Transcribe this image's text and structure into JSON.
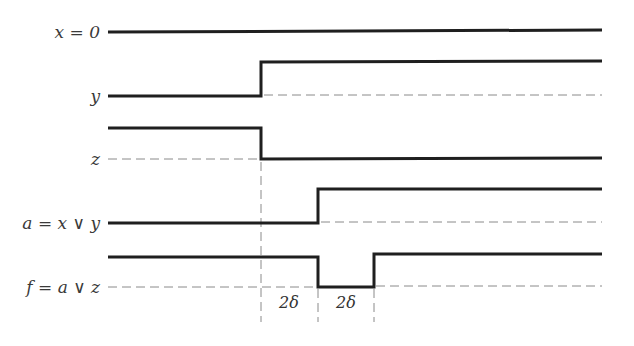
{
  "diagram": {
    "type": "timing-diagram",
    "signals": [
      {
        "id": "x",
        "label": "x = 0",
        "label_y": 38,
        "levels": "constant-high-line",
        "y_line": 32
      },
      {
        "id": "y",
        "label": "y",
        "label_y": 102,
        "low_y": 96,
        "high_y": 62,
        "rise_at": 261
      },
      {
        "id": "z",
        "label": "z",
        "label_y": 165,
        "low_y": 159,
        "high_y": 128,
        "fall_at": 261
      },
      {
        "id": "a",
        "label": "a = x ∨ y",
        "label_y": 229,
        "low_y": 223,
        "high_y": 189,
        "rise_at": 318
      },
      {
        "id": "f",
        "label": "f = a ∨ z",
        "label_y": 293,
        "low_y": 287,
        "high_y": 257,
        "fall_at": 318,
        "rise_at": 374
      }
    ],
    "delays": [
      {
        "label": "2δ",
        "x_center": 289
      },
      {
        "label": "2δ",
        "x_center": 346
      }
    ],
    "x_start": 108,
    "x_end": 602,
    "colors": {
      "signal": "#1f1f1f",
      "reference": "#8a8a8a",
      "text": "#3a3a3a"
    }
  }
}
